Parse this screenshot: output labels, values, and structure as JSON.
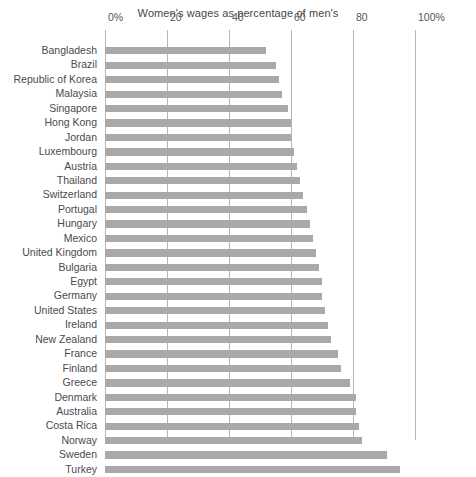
{
  "chart_data": {
    "type": "bar",
    "orientation": "horizontal",
    "title": "Women's wages as percentage of men's",
    "xlabel": "",
    "ylabel": "",
    "xlim": [
      0,
      100
    ],
    "grid": "vertical",
    "legend": "none",
    "tick_labels": [
      "0%",
      "20",
      "40",
      "60",
      "80",
      "100%"
    ],
    "tick_values": [
      0,
      20,
      40,
      60,
      80,
      100
    ],
    "bar_color": "#a9a9a9",
    "gridline_color": "#b6b6b6",
    "categories": [
      "Bangladesh",
      "Brazil",
      "Republic of Korea",
      "Malaysia",
      "Singapore",
      "Hong Kong",
      "Jordan",
      "Luxembourg",
      "Austria",
      "Thailand",
      "Switzerland",
      "Portugal",
      "Hungary",
      "Mexico",
      "United Kingdom",
      "Bulgaria",
      "Egypt",
      "Germany",
      "United States",
      "Ireland",
      "New Zealand",
      "France",
      "Finland",
      "Greece",
      "Denmark",
      "Australia",
      "Costa Rica",
      "Norway",
      "Sweden",
      "Turkey"
    ],
    "values": [
      52,
      55,
      56,
      57,
      59,
      60,
      60,
      61,
      62,
      63,
      64,
      65,
      66,
      67,
      68,
      69,
      70,
      70,
      71,
      72,
      73,
      75,
      76,
      79,
      81,
      81,
      82,
      83,
      91,
      95
    ]
  }
}
